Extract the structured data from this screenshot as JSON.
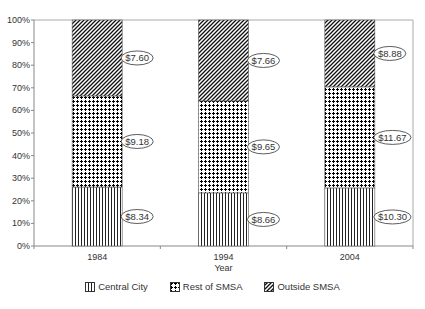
{
  "chart_data": {
    "type": "bar",
    "stacked": true,
    "percent_stacked": true,
    "title": "",
    "xlabel": "Year",
    "ylabel": "",
    "ylim": [
      0,
      100
    ],
    "yticks": [
      "0%",
      "10%",
      "20%",
      "30%",
      "40%",
      "50%",
      "60%",
      "70%",
      "80%",
      "90%",
      "100%"
    ],
    "grid": false,
    "legend_position": "bottom",
    "categories": [
      "1984",
      "1994",
      "2004"
    ],
    "series": [
      {
        "name": "Central City",
        "pattern": "vertical-lines",
        "values": [
          26.1,
          23.5,
          25.7
        ],
        "labels": [
          "$8.34",
          "$8.66",
          "$10.30"
        ]
      },
      {
        "name": "Rest of SMSA",
        "pattern": "checker-dots",
        "values": [
          40.3,
          40.7,
          44.7
        ],
        "labels": [
          "$9.18",
          "$9.65",
          "$11.67"
        ]
      },
      {
        "name": "Outside SMSA",
        "pattern": "diagonal-lines",
        "values": [
          33.6,
          35.8,
          29.6
        ],
        "labels": [
          "$7.60",
          "$7.66",
          "$8.88"
        ]
      }
    ]
  },
  "colors": {
    "axis": "#888888",
    "pattern_ink": "#111111",
    "text": "#333333"
  }
}
